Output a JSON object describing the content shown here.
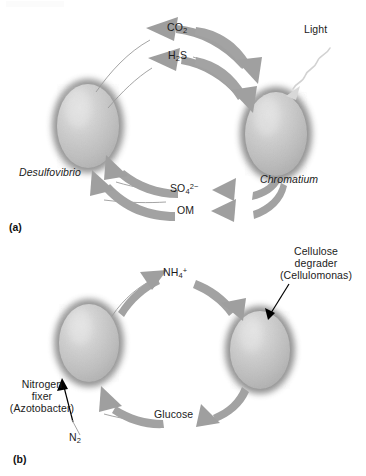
{
  "figure": {
    "title_hidden_artifact": "",
    "panels": [
      {
        "tag": "(a)",
        "name": "sulfur-cycle-syntrophy",
        "organisms": [
          {
            "name": "Desulfovibrio",
            "italic": true,
            "side": "left"
          },
          {
            "name": "Chromatium",
            "italic": true,
            "side": "right"
          }
        ],
        "energy_label": "Light",
        "metabolites": [
          {
            "text": "CO2",
            "base": "CO",
            "sub": "2",
            "sup": "",
            "direction": "left-to-right"
          },
          {
            "text": "H2S",
            "base": "H",
            "sub": "2",
            "sup": "",
            "tail": "S",
            "direction": "left-to-right"
          },
          {
            "text": "SO42-",
            "base": "SO",
            "sub": "4",
            "sup": "2−",
            "direction": "right-to-left"
          },
          {
            "text": "OM",
            "base": "OM",
            "sub": "",
            "sup": "",
            "direction": "right-to-left"
          }
        ]
      },
      {
        "tag": "(b)",
        "name": "nitrogen-carbon-cycle-syntrophy",
        "organisms": [
          {
            "name": "Nitrogen fixer (Azotobacter)",
            "lines": [
              "Nitrogen",
              "fixer",
              "(Azotobacter)"
            ],
            "side": "left"
          },
          {
            "name": "Cellulose degrader (Cellulomonas)",
            "lines": [
              "Cellulose",
              "degrader",
              "(Cellulomonas)"
            ],
            "side": "right"
          }
        ],
        "inputs": [
          {
            "base": "N",
            "sub": "2",
            "sup": "",
            "text": "N2"
          }
        ],
        "metabolites": [
          {
            "text": "NH4+",
            "base": "NH",
            "sub": "4",
            "sup": "+",
            "direction": "left-to-right"
          },
          {
            "text": "Glucose",
            "base": "Glucose",
            "sub": "",
            "sup": "",
            "direction": "right-to-left"
          }
        ]
      }
    ],
    "colors": {
      "arrow_gray": "#9d9d9d",
      "arrow_gray_dark": "#8c8c8c",
      "cell_rim": "#8e8e8e",
      "cell_body_light": "#d4d4d4",
      "cell_body_mid": "#b8b8b8",
      "text": "#1b1b1b",
      "pointer_black": "#000000",
      "light_ray": "#d8d8d8",
      "background": "#ffffff"
    }
  }
}
